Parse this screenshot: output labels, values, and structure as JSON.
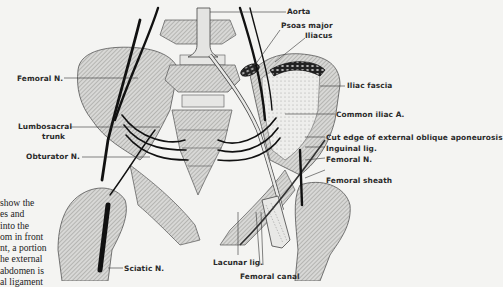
{
  "figure": {
    "labels": {
      "aorta": "Aorta",
      "psoas_major": "Psoas major",
      "iliacus": "Iliacus",
      "femoral_n_left": "Femoral N.",
      "iliac_fascia": "Iliac fascia",
      "common_iliac_a": "Common iliac A.",
      "lumbosacral_trunk_1": "Lumbosacral",
      "lumbosacral_trunk_2": "trunk",
      "obturator_n": "Obturator N.",
      "cut_edge": "Cut edge of external oblique aponeurosis",
      "inguinal_lig": "Inguinal lig.",
      "femoral_n_right": "Femoral N.",
      "femoral_sheath": "Femoral sheath",
      "sciatic_n": "Sciatic N.",
      "lacunar_lig": "Lacunar lig.",
      "femoral_canal": "Femoral canal"
    }
  },
  "caption_lines": [
    "show the",
    "es and",
    "into the",
    "om in front",
    "nt, a portion",
    "he external",
    "abdomen is",
    "al ligament"
  ]
}
